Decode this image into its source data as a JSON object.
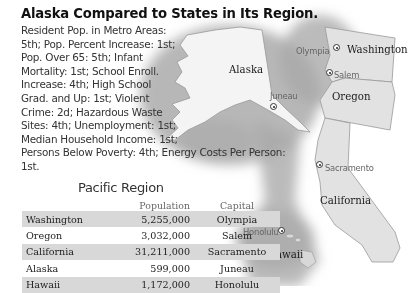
{
  "title": "Alaska Compared to States in Its Region.",
  "stats_lines": [
    "Resident Pop. in Metro Areas:",
    "5th; Pop. Percent Increase: 1st;",
    "Pop. Over 65: 5th; Infant",
    "Mortality: 1st; School Enroll.",
    "Increase: 4th; High School",
    "Grad. and Up: 1st; Violent",
    "Crime: 2d; Hazardous Waste",
    "Sites: 4th; Unemployment: 1st;",
    "Median Household Income: 1st;",
    "Persons Below Poverty: 4th; Energy Costs Per Person:",
    "1st."
  ],
  "map": {
    "states": [
      "Alaska",
      "Washington",
      "Oregon",
      "California",
      "Hawaii"
    ],
    "capitals": [
      "Juneau",
      "Olympia",
      "Salem",
      "Sacramento",
      "Honolulu"
    ]
  },
  "table": {
    "title": "Pacific Region",
    "headers": [
      "",
      "Population",
      "Capital"
    ],
    "rows": [
      {
        "state": "Washington",
        "population": "5,255,000",
        "capital": "Olympia"
      },
      {
        "state": "Oregon",
        "population": "3,032,000",
        "capital": "Salem"
      },
      {
        "state": "California",
        "population": "31,211,000",
        "capital": "Sacramento"
      },
      {
        "state": "Alaska",
        "population": "599,000",
        "capital": "Juneau"
      },
      {
        "state": "Hawaii",
        "population": "1,172,000",
        "capital": "Honolulu"
      }
    ]
  },
  "colors": {
    "land": "#e6e6e6",
    "ocean_shadow": "#9a9a9a",
    "row_shade": "#d8d8d8"
  }
}
